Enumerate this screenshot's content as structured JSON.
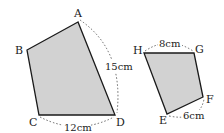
{
  "colors": {
    "fill": "#d2d2d2",
    "stroke": "#1a1a1a",
    "dashed": "#555555",
    "text": "#222222"
  },
  "figures": [
    {
      "name": "quadrilateral ABCD",
      "vertices": {
        "A": {
          "label": "A",
          "x": 78,
          "y": 22
        },
        "B": {
          "label": "B",
          "x": 27,
          "y": 50
        },
        "C": {
          "label": "C",
          "x": 39,
          "y": 115
        },
        "D": {
          "label": "D",
          "x": 115,
          "y": 115
        }
      },
      "measurements": [
        {
          "side": "AD",
          "label": "15cm"
        },
        {
          "side": "CD",
          "label": "12cm"
        }
      ]
    },
    {
      "name": "quadrilateral EFGH",
      "vertices": {
        "H": {
          "label": "H",
          "x": 144,
          "y": 53
        },
        "G": {
          "label": "G",
          "x": 194,
          "y": 53
        },
        "F": {
          "label": "F",
          "x": 203,
          "y": 97
        },
        "E": {
          "label": "E",
          "x": 167,
          "y": 114
        }
      },
      "measurements": [
        {
          "side": "HG",
          "label": "8cm"
        },
        {
          "side": "EF",
          "label": "6cm"
        }
      ]
    }
  ]
}
